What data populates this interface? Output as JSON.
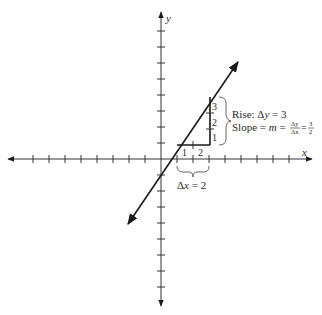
{
  "diagram": {
    "type": "coordinate-plane-slope",
    "axes": {
      "x_label": "x",
      "y_label": "y",
      "tick_spacing_px": 16,
      "ticks_each_direction": 8
    },
    "line": {
      "slope": "3/2",
      "description": "line with arrows at both ends passing near origin"
    },
    "run": {
      "tick_labels": [
        "1",
        "2"
      ],
      "brace_label_prefix": "Δ",
      "brace_label_var": "x",
      "brace_label_value": " = 2"
    },
    "rise": {
      "tick_labels": [
        "1",
        "2",
        "3"
      ],
      "label_line1_prefix": "Rise: Δ",
      "label_line1_var": "y",
      "label_line1_value": " = 3",
      "label_line2_prefix": "Slope = ",
      "label_line2_var": "m",
      "label_line2_eq": " = ",
      "frac1_num": "Δy",
      "frac1_den": "Δx",
      "eq2": "=",
      "frac2_num": "3",
      "frac2_den": "2"
    },
    "colors": {
      "axis": "#333333",
      "line": "#1a1a1a",
      "text": "#2a2a2a",
      "brace": "#555555"
    }
  }
}
